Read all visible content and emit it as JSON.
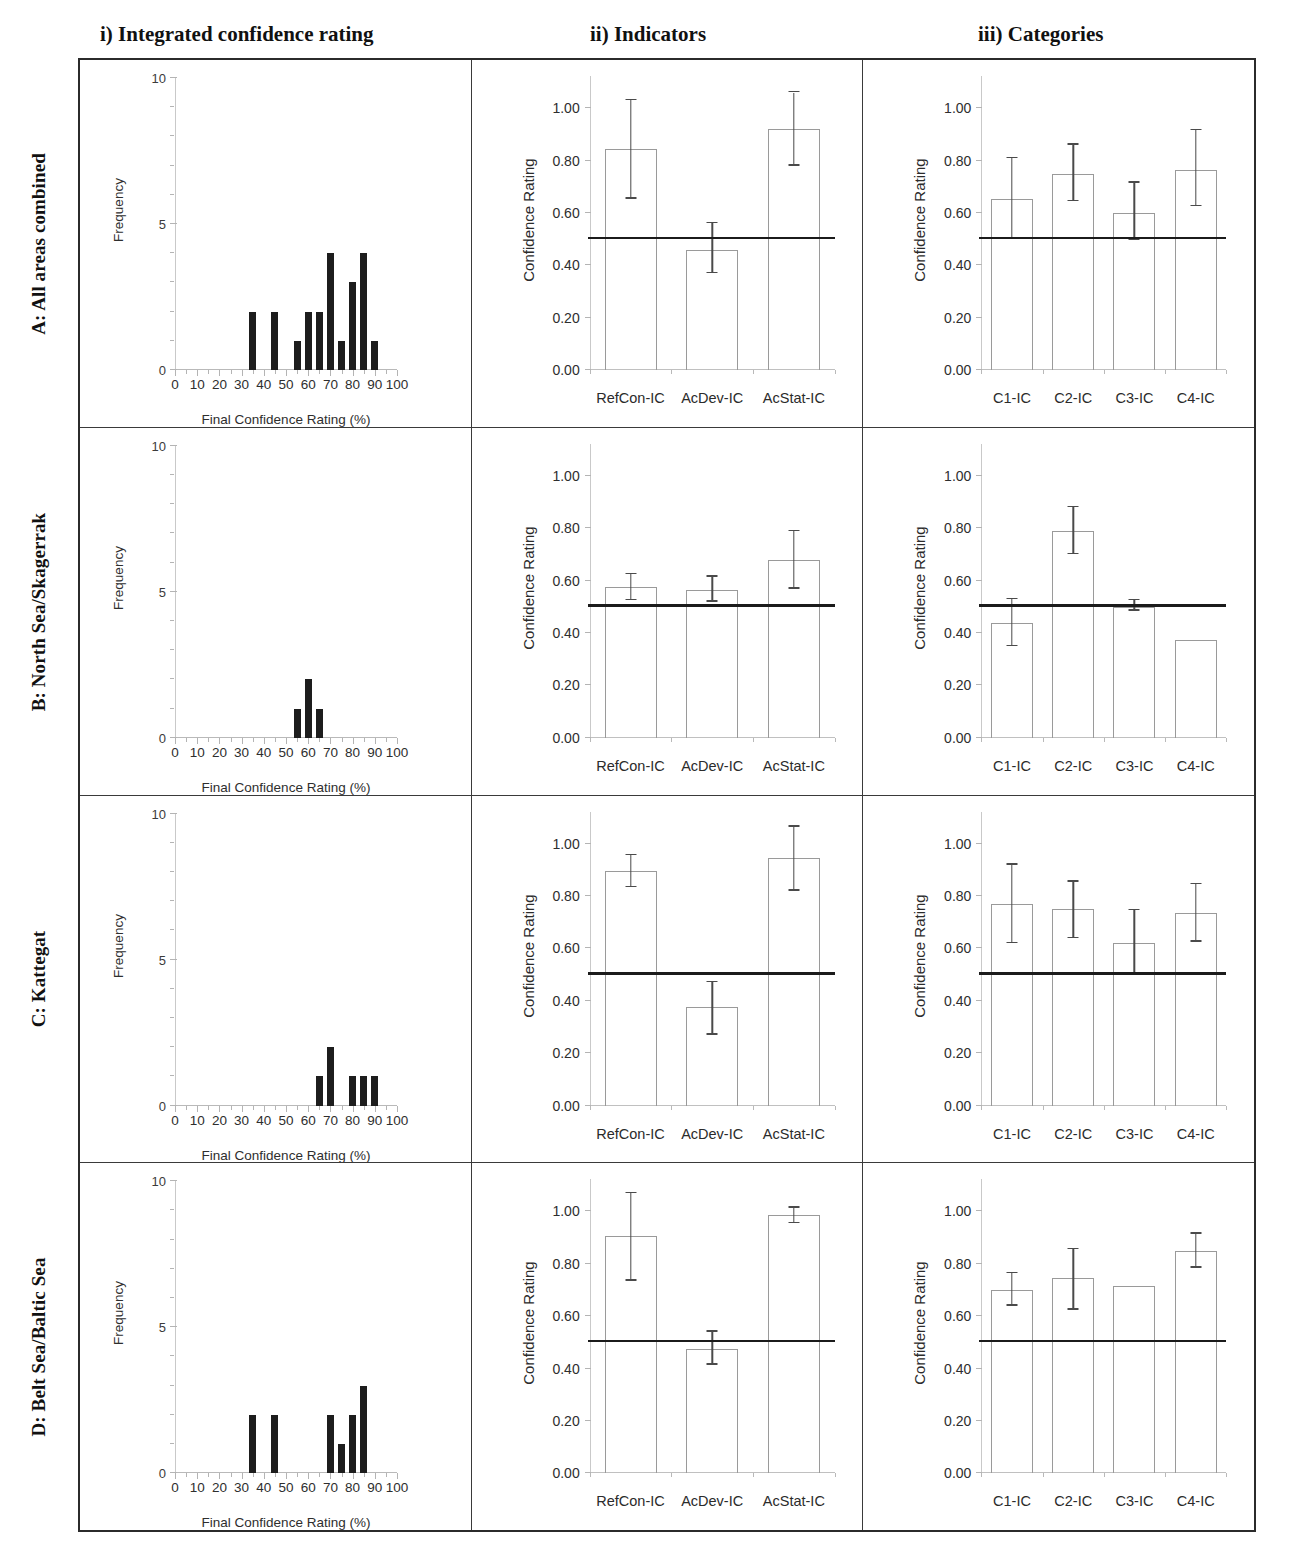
{
  "columns": [
    {
      "id": "i",
      "label": "i) Integrated confidence rating"
    },
    {
      "id": "ii",
      "label": "ii) Indicators"
    },
    {
      "id": "iii",
      "label": "iii) Categories"
    }
  ],
  "rows": [
    {
      "id": "A",
      "label": "A: All areas combined"
    },
    {
      "id": "B",
      "label": "B: North Sea/Skagerrak"
    },
    {
      "id": "C",
      "label": "C: Kattegat"
    },
    {
      "id": "D",
      "label": "D: Belt Sea/Baltic Sea"
    }
  ],
  "axes": {
    "hist_ylabel": "Frequency",
    "hist_xlabel": "Final Confidence Rating (%)",
    "hist_yticks": [
      "0",
      "5",
      "10"
    ],
    "hist_xticks": [
      "0",
      "10",
      "20",
      "30",
      "40",
      "50",
      "60",
      "70",
      "80",
      "90",
      "100"
    ],
    "bar_ylabel": "Confidence Rating",
    "bar_yticks": [
      "0.00",
      "0.20",
      "0.40",
      "0.60",
      "0.80",
      "1.00"
    ],
    "indicator_categories": [
      "RefCon-IC",
      "AcDev-IC",
      "AcStat-IC"
    ],
    "category_categories": [
      "C1-IC",
      "C2-IC",
      "C3-IC",
      "C4-IC"
    ]
  },
  "colors": {
    "bar_fill": "#1d1d1d",
    "bar_outline": "#9a9a9a",
    "reference_line": "#1b1b1b",
    "axis": "#c0c0c0",
    "text": "#2b2b2b"
  },
  "chart_data": [
    {
      "id": "A-i",
      "type": "bar",
      "panel": "i) Integrated confidence rating",
      "row": "A: All areas combined",
      "title": "",
      "xlabel": "Final Confidence Rating (%)",
      "ylabel": "Frequency",
      "xlim": [
        0,
        100
      ],
      "ylim": [
        0,
        10
      ],
      "grid": false,
      "legend": "none",
      "categories": [
        35,
        45,
        55,
        60,
        65,
        70,
        75,
        80,
        85,
        90
      ],
      "values": [
        2,
        2,
        1,
        2,
        2,
        4,
        1,
        3,
        4,
        1
      ]
    },
    {
      "id": "A-ii",
      "type": "bar",
      "panel": "ii) Indicators",
      "row": "A: All areas combined",
      "title": "",
      "xlabel": "",
      "ylabel": "Confidence Rating",
      "ylim": [
        0,
        1.1
      ],
      "grid": false,
      "legend": "none",
      "reference_line": 0.5,
      "categories": [
        "RefCon-IC",
        "AcDev-IC",
        "AcStat-IC"
      ],
      "values": [
        0.845,
        0.46,
        0.92
      ],
      "err_low": [
        0.655,
        0.37,
        0.78
      ],
      "err_high": [
        1.03,
        0.56,
        1.06
      ]
    },
    {
      "id": "A-iii",
      "type": "bar",
      "panel": "iii) Categories",
      "row": "A: All areas combined",
      "title": "",
      "xlabel": "",
      "ylabel": "Confidence Rating",
      "ylim": [
        0,
        1.1
      ],
      "grid": false,
      "legend": "none",
      "reference_line": 0.5,
      "categories": [
        "C1-IC",
        "C2-IC",
        "C3-IC",
        "C4-IC"
      ],
      "values": [
        0.655,
        0.75,
        0.6,
        0.765
      ],
      "err_low": [
        0.5,
        0.645,
        0.495,
        0.625
      ],
      "err_high": [
        0.81,
        0.86,
        0.715,
        0.915
      ]
    },
    {
      "id": "B-i",
      "type": "bar",
      "panel": "i) Integrated confidence rating",
      "row": "B: North Sea/Skagerrak",
      "title": "",
      "xlabel": "Final Confidence Rating (%)",
      "ylabel": "Frequency",
      "xlim": [
        0,
        100
      ],
      "ylim": [
        0,
        10
      ],
      "grid": false,
      "legend": "none",
      "categories": [
        55,
        60,
        65
      ],
      "values": [
        1,
        2,
        1
      ]
    },
    {
      "id": "B-ii",
      "type": "bar",
      "panel": "ii) Indicators",
      "row": "B: North Sea/Skagerrak",
      "title": "",
      "xlabel": "",
      "ylabel": "Confidence Rating",
      "ylim": [
        0,
        1.1
      ],
      "grid": false,
      "legend": "none",
      "reference_line": 0.5,
      "categories": [
        "RefCon-IC",
        "AcDev-IC",
        "AcStat-IC"
      ],
      "values": [
        0.575,
        0.565,
        0.68
      ],
      "err_low": [
        0.525,
        0.52,
        0.57
      ],
      "err_high": [
        0.625,
        0.615,
        0.79
      ]
    },
    {
      "id": "B-iii",
      "type": "bar",
      "panel": "iii) Categories",
      "row": "B: North Sea/Skagerrak",
      "title": "",
      "xlabel": "",
      "ylabel": "Confidence Rating",
      "ylim": [
        0,
        1.1
      ],
      "grid": false,
      "legend": "none",
      "reference_line": 0.5,
      "categories": [
        "C1-IC",
        "C2-IC",
        "C3-IC",
        "C4-IC"
      ],
      "values": [
        0.44,
        0.79,
        0.5,
        0.375
      ],
      "err_low": [
        0.35,
        0.7,
        0.485,
        null
      ],
      "err_high": [
        0.53,
        0.88,
        0.525,
        null
      ]
    },
    {
      "id": "C-i",
      "type": "bar",
      "panel": "i) Integrated confidence rating",
      "row": "C: Kattegat",
      "title": "",
      "xlabel": "Final Confidence Rating (%)",
      "ylabel": "Frequency",
      "xlim": [
        0,
        100
      ],
      "ylim": [
        0,
        10
      ],
      "grid": false,
      "legend": "none",
      "categories": [
        65,
        70,
        80,
        85,
        90
      ],
      "values": [
        1,
        2,
        1,
        1,
        1
      ]
    },
    {
      "id": "C-ii",
      "type": "bar",
      "panel": "ii) Indicators",
      "row": "C: Kattegat",
      "title": "",
      "xlabel": "",
      "ylabel": "Confidence Rating",
      "ylim": [
        0,
        1.1
      ],
      "grid": false,
      "legend": "none",
      "reference_line": 0.5,
      "categories": [
        "RefCon-IC",
        "AcDev-IC",
        "AcStat-IC"
      ],
      "values": [
        0.895,
        0.375,
        0.945
      ],
      "err_low": [
        0.835,
        0.27,
        0.82
      ],
      "err_high": [
        0.955,
        0.47,
        1.065
      ]
    },
    {
      "id": "C-iii",
      "type": "bar",
      "panel": "iii) Categories",
      "row": "C: Kattegat",
      "title": "",
      "xlabel": "",
      "ylabel": "Confidence Rating",
      "ylim": [
        0,
        1.1
      ],
      "grid": false,
      "legend": "none",
      "reference_line": 0.5,
      "categories": [
        "C1-IC",
        "C2-IC",
        "C3-IC",
        "C4-IC"
      ],
      "values": [
        0.77,
        0.75,
        0.62,
        0.735
      ],
      "err_low": [
        0.62,
        0.64,
        0.5,
        0.625
      ],
      "err_high": [
        0.92,
        0.855,
        0.745,
        0.845
      ]
    },
    {
      "id": "D-i",
      "type": "bar",
      "panel": "i) Integrated confidence rating",
      "row": "D: Belt Sea/Baltic Sea",
      "title": "",
      "xlabel": "Final Confidence Rating (%)",
      "ylabel": "Frequency",
      "xlim": [
        0,
        100
      ],
      "ylim": [
        0,
        10
      ],
      "grid": false,
      "legend": "none",
      "categories": [
        35,
        45,
        70,
        75,
        80,
        85
      ],
      "values": [
        2,
        2,
        2,
        1,
        2,
        3
      ]
    },
    {
      "id": "D-ii",
      "type": "bar",
      "panel": "ii) Indicators",
      "row": "D: Belt Sea/Baltic Sea",
      "title": "",
      "xlabel": "",
      "ylabel": "Confidence Rating",
      "ylim": [
        0,
        1.1
      ],
      "grid": false,
      "legend": "none",
      "reference_line": 0.5,
      "categories": [
        "RefCon-IC",
        "AcDev-IC",
        "AcStat-IC"
      ],
      "values": [
        0.905,
        0.475,
        0.985
      ],
      "err_low": [
        0.735,
        0.415,
        0.955
      ],
      "err_high": [
        1.07,
        0.54,
        1.015
      ]
    },
    {
      "id": "D-iii",
      "type": "bar",
      "panel": "iii) Categories",
      "row": "D: Belt Sea/Baltic Sea",
      "title": "",
      "xlabel": "",
      "ylabel": "Confidence Rating",
      "ylim": [
        0,
        1.1
      ],
      "grid": false,
      "legend": "none",
      "reference_line": 0.5,
      "categories": [
        "C1-IC",
        "C2-IC",
        "C3-IC",
        "C4-IC"
      ],
      "values": [
        0.7,
        0.745,
        0.715,
        0.85
      ],
      "err_low": [
        0.64,
        0.625,
        null,
        0.785
      ],
      "err_high": [
        0.765,
        0.855,
        null,
        0.915
      ]
    }
  ]
}
